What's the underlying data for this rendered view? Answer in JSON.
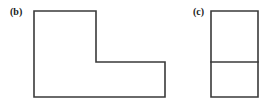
{
  "figure": {
    "background_color": "#ffffff",
    "stroke_color": "#3a3a3a",
    "fill_color": "#ffffff",
    "width": 270,
    "height": 104,
    "panels": [
      {
        "id": "b",
        "label": "(b)",
        "label_x": 10,
        "label_y": 7,
        "shape_type": "L-shaped polygon",
        "vertices": [
          [
            34,
            11
          ],
          [
            96,
            11
          ],
          [
            96,
            62
          ],
          [
            165,
            62
          ],
          [
            165,
            97
          ],
          [
            34,
            97
          ]
        ],
        "path": "M34,11 L96,11 L96,62 L165,62 L165,97 L34,97 Z",
        "internal_lines": []
      },
      {
        "id": "c",
        "label": "(c)",
        "label_x": 193,
        "label_y": 7,
        "shape_type": "rectangle divided into two squares",
        "vertices": [
          [
            211,
            11
          ],
          [
            258,
            11
          ],
          [
            258,
            97
          ],
          [
            211,
            97
          ]
        ],
        "path": "M211,11 L258,11 L258,97 L211,97 Z",
        "internal_lines": [
          {
            "x1": 211,
            "y1": 62,
            "x2": 258,
            "y2": 62
          }
        ]
      }
    ]
  }
}
